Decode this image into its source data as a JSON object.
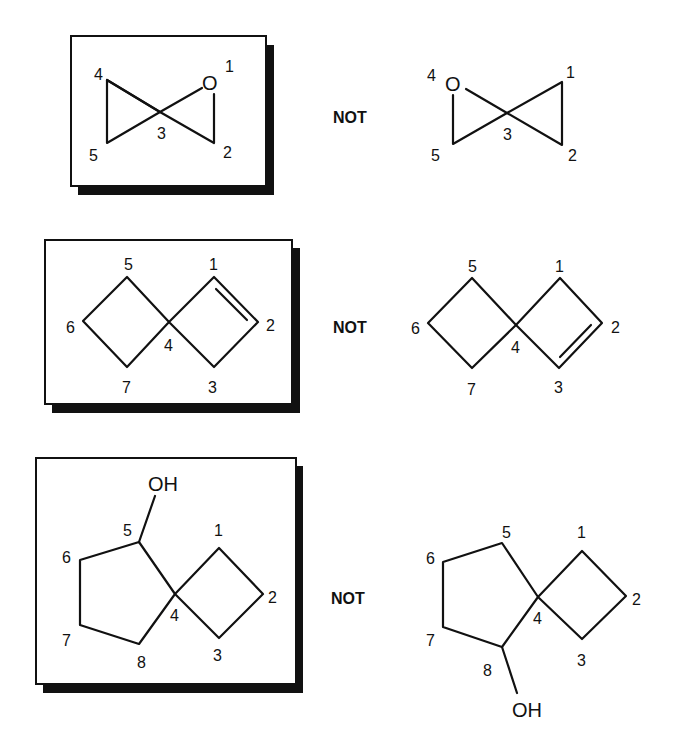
{
  "figure": {
    "top_fragment": "",
    "comparison_word": "NOT",
    "rows": [
      {
        "id": "oxaspiro-pentane",
        "correct": {
          "atom_labels": [
            "O"
          ],
          "numbers": [
            "1",
            "2",
            "3",
            "4",
            "5"
          ]
        },
        "incorrect": {
          "atom_labels": [
            "O"
          ],
          "numbers": [
            "1",
            "2",
            "3",
            "4",
            "5"
          ]
        },
        "not_label": "NOT"
      },
      {
        "id": "spiro-heptene",
        "correct": {
          "numbers": [
            "1",
            "2",
            "3",
            "4",
            "5",
            "6",
            "7"
          ],
          "double_bond": "1-2"
        },
        "incorrect": {
          "numbers": [
            "1",
            "2",
            "3",
            "4",
            "5",
            "6",
            "7"
          ],
          "double_bond": "2-3"
        },
        "not_label": "NOT"
      },
      {
        "id": "spiro-octanol",
        "correct": {
          "atom_labels": [
            "OH"
          ],
          "numbers": [
            "1",
            "2",
            "3",
            "4",
            "5",
            "6",
            "7",
            "8"
          ],
          "oh_position": "5"
        },
        "incorrect": {
          "atom_labels": [
            "OH"
          ],
          "numbers": [
            "1",
            "2",
            "3",
            "4",
            "5",
            "6",
            "7",
            "8"
          ],
          "oh_position": "8"
        },
        "not_label": "NOT"
      }
    ]
  }
}
